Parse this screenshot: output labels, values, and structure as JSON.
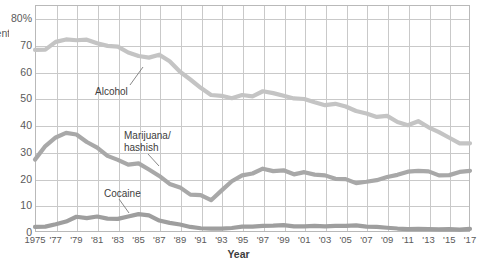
{
  "axes": {
    "y_label_fragment": "Percent reporting use",
    "y_ticks": [
      "80%",
      "70",
      "60",
      "50",
      "40",
      "30",
      "20",
      "10",
      "0"
    ],
    "y_values": [
      80,
      70,
      60,
      50,
      40,
      30,
      20,
      10,
      0
    ],
    "x_title": "Year",
    "x_ticks": [
      "1975",
      "'77",
      "'79",
      "'81",
      "'83",
      "'85",
      "'87",
      "'89",
      "'91",
      "'93",
      "'95",
      "'97",
      "'99",
      "'01",
      "'03",
      "'05",
      "'07",
      "'09",
      "'11",
      "'13",
      "'15",
      "'17"
    ],
    "x_tick_years": [
      1975,
      1977,
      1979,
      1981,
      1983,
      1985,
      1987,
      1989,
      1991,
      1993,
      1995,
      1997,
      1999,
      2001,
      2003,
      2005,
      2007,
      2009,
      2011,
      2013,
      2015,
      2017
    ]
  },
  "annotations": [
    {
      "name": "alcohol",
      "label": "Alcohol",
      "x": 95,
      "y": 86,
      "leader": [
        130,
        85,
        143,
        67
      ]
    },
    {
      "name": "marijuana",
      "label": "Marijuana/\nhashish",
      "x": 124,
      "y": 130,
      "leader": [
        148,
        154,
        159,
        166
      ]
    },
    {
      "name": "cocaine",
      "label": "Cocaine",
      "x": 104,
      "y": 188,
      "leader": [
        119,
        199,
        129,
        213
      ]
    }
  ],
  "colors": {
    "alcohol": "#c4c4c4",
    "marijuana": "#a8a8a8",
    "cocaine": "#9e9e9e",
    "grid": "#c9c9c9",
    "frame": "#b9b9b9",
    "text": "#5a5a5a"
  },
  "chart_data": {
    "type": "line",
    "title": "",
    "xlabel": "Year",
    "ylabel": "Percent reporting use",
    "xlim": [
      1975,
      2017
    ],
    "ylim": [
      0,
      85
    ],
    "grid": true,
    "legend": "annotations-inline",
    "x": [
      1975,
      1976,
      1977,
      1978,
      1979,
      1980,
      1981,
      1982,
      1983,
      1984,
      1985,
      1986,
      1987,
      1988,
      1989,
      1990,
      1991,
      1992,
      1993,
      1994,
      1995,
      1996,
      1997,
      1998,
      1999,
      2000,
      2001,
      2002,
      2003,
      2004,
      2005,
      2006,
      2007,
      2008,
      2009,
      2010,
      2011,
      2012,
      2013,
      2014,
      2015,
      2016,
      2017
    ],
    "series": [
      {
        "name": "Alcohol",
        "color": "#c4c4c4",
        "values": [
          68.2,
          68.3,
          71.2,
          72.1,
          71.8,
          72.0,
          70.7,
          69.7,
          69.4,
          67.2,
          65.9,
          65.3,
          66.4,
          63.9,
          60.0,
          57.1,
          54.0,
          51.3,
          51.0,
          50.1,
          51.3,
          50.8,
          52.7,
          52.0,
          51.0,
          50.0,
          49.8,
          48.6,
          47.5,
          48.0,
          47.0,
          45.3,
          44.4,
          43.1,
          43.5,
          41.2,
          40.0,
          41.5,
          39.2,
          37.4,
          35.3,
          33.2,
          33.2
        ]
      },
      {
        "name": "Marijuana/hashish",
        "color": "#a8a8a8",
        "values": [
          27.1,
          32.2,
          35.4,
          37.1,
          36.5,
          33.7,
          31.6,
          28.5,
          27.0,
          25.2,
          25.7,
          23.4,
          21.0,
          18.0,
          16.7,
          14.0,
          13.8,
          11.9,
          15.5,
          19.0,
          21.2,
          21.9,
          23.7,
          22.8,
          23.1,
          21.6,
          22.4,
          21.5,
          21.2,
          19.9,
          19.8,
          18.3,
          18.8,
          19.4,
          20.6,
          21.4,
          22.6,
          22.9,
          22.7,
          21.2,
          21.3,
          22.5,
          22.9
        ]
      },
      {
        "name": "Cocaine",
        "color": "#9e9e9e",
        "values": [
          1.9,
          2.0,
          2.9,
          3.9,
          5.7,
          5.2,
          5.8,
          5.0,
          4.9,
          5.8,
          6.7,
          6.2,
          4.3,
          3.4,
          2.8,
          1.9,
          1.4,
          1.3,
          1.3,
          1.5,
          2.0,
          2.0,
          2.3,
          2.4,
          2.6,
          2.1,
          2.1,
          2.3,
          2.1,
          2.3,
          2.3,
          2.5,
          2.0,
          1.9,
          1.6,
          1.3,
          1.1,
          1.2,
          1.1,
          1.0,
          1.1,
          0.9,
          1.2
        ]
      }
    ]
  }
}
